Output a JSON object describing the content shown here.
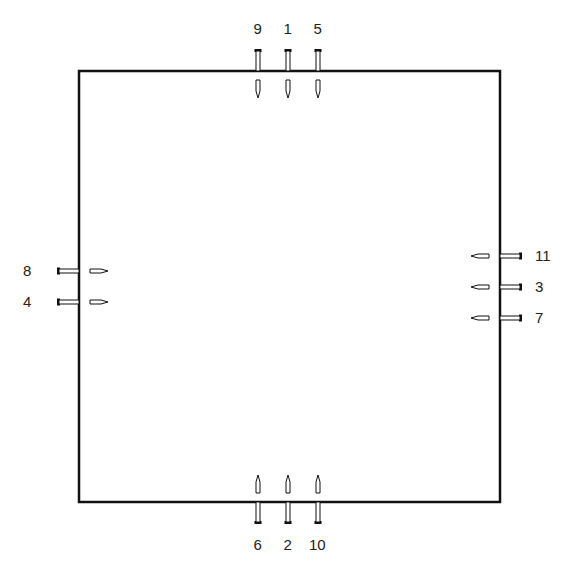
{
  "diagram": {
    "box": {
      "left": 79,
      "top": 71,
      "right": 500,
      "bottom": 502
    },
    "top_nails": [
      {
        "label": "9",
        "x": 258
      },
      {
        "label": "1",
        "x": 288
      },
      {
        "label": "5",
        "x": 318
      }
    ],
    "bottom_nails": [
      {
        "label": "6",
        "x": 258
      },
      {
        "label": "2",
        "x": 288
      },
      {
        "label": "10",
        "x": 318
      }
    ],
    "left_nails": [
      {
        "label": "8",
        "y": 271
      },
      {
        "label": "4",
        "y": 302
      }
    ],
    "right_nails": [
      {
        "label": "11",
        "y": 256
      },
      {
        "label": "3",
        "y": 287
      },
      {
        "label": "7",
        "y": 318
      }
    ]
  }
}
